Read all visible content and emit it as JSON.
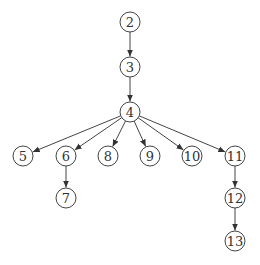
{
  "diagram": {
    "type": "tree",
    "style": {
      "node_stroke": "#444444",
      "node_fill": "#ffffff",
      "edge_color": "#444444",
      "text_color": "#333333",
      "node_radius": 10
    },
    "nodes": [
      {
        "id": "n2",
        "label": "2",
        "x": 130,
        "y": 22
      },
      {
        "id": "n3",
        "label": "3",
        "x": 130,
        "y": 67
      },
      {
        "id": "n4",
        "label": "4",
        "x": 130,
        "y": 112
      },
      {
        "id": "n5",
        "label": "5",
        "x": 23,
        "y": 156
      },
      {
        "id": "n6",
        "label": "6",
        "x": 66,
        "y": 156
      },
      {
        "id": "n8",
        "label": "8",
        "x": 108,
        "y": 156
      },
      {
        "id": "n9",
        "label": "9",
        "x": 150,
        "y": 156
      },
      {
        "id": "n10",
        "label": "10",
        "x": 192,
        "y": 156
      },
      {
        "id": "n11",
        "label": "11",
        "x": 235,
        "y": 156
      },
      {
        "id": "n7",
        "label": "7",
        "x": 66,
        "y": 198
      },
      {
        "id": "n12",
        "label": "12",
        "x": 235,
        "y": 198
      },
      {
        "id": "n13",
        "label": "13",
        "x": 235,
        "y": 241
      }
    ],
    "edges": [
      {
        "from": "n2",
        "to": "n3"
      },
      {
        "from": "n3",
        "to": "n4"
      },
      {
        "from": "n4",
        "to": "n5"
      },
      {
        "from": "n4",
        "to": "n6"
      },
      {
        "from": "n4",
        "to": "n8"
      },
      {
        "from": "n4",
        "to": "n9"
      },
      {
        "from": "n4",
        "to": "n10"
      },
      {
        "from": "n4",
        "to": "n11"
      },
      {
        "from": "n6",
        "to": "n7"
      },
      {
        "from": "n11",
        "to": "n12"
      },
      {
        "from": "n12",
        "to": "n13"
      }
    ]
  }
}
